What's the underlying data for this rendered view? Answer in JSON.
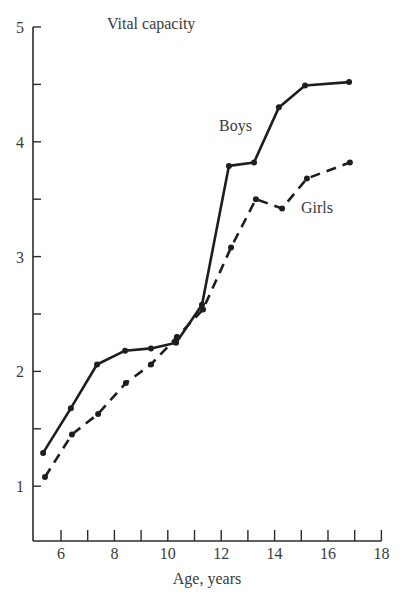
{
  "chart_data": {
    "type": "line",
    "title": "Vital capacity",
    "xlabel": "Age, years",
    "ylabel": "",
    "xlim": [
      5,
      18
    ],
    "ylim": [
      0.52,
      5
    ],
    "x_ticks": [
      6,
      8,
      10,
      12,
      14,
      16,
      18
    ],
    "x_minor_ticks": [
      6,
      7,
      8,
      9,
      10,
      11,
      12,
      13,
      14,
      15,
      16,
      17,
      18
    ],
    "y_ticks": [
      1,
      2,
      3,
      4,
      5
    ],
    "y_minor_ticks": [
      1,
      1.5,
      2,
      2.5,
      3,
      3.5,
      4,
      4.5,
      5
    ],
    "grid": false,
    "legend": "inline labels",
    "series": [
      {
        "name": "Boys",
        "style": "solid",
        "label_pos": [
          13.0,
          4.1
        ],
        "x": [
          5.33,
          6.37,
          7.35,
          8.4,
          9.37,
          10.31,
          11.28,
          12.29,
          13.23,
          14.16,
          15.14,
          16.79
        ],
        "values": [
          1.29,
          1.68,
          2.06,
          2.18,
          2.2,
          2.25,
          2.58,
          3.79,
          3.82,
          4.3,
          4.49,
          4.52
        ]
      },
      {
        "name": "Girls",
        "style": "dashed",
        "label_pos": [
          14.9,
          3.4
        ],
        "x": [
          5.4,
          6.41,
          7.39,
          8.43,
          9.37,
          10.34,
          11.32,
          12.37,
          13.3,
          14.28,
          15.21,
          16.82
        ],
        "values": [
          1.08,
          1.45,
          1.63,
          1.9,
          2.06,
          2.3,
          2.54,
          3.08,
          3.5,
          3.42,
          3.68,
          3.82
        ]
      }
    ]
  },
  "labels": {
    "title": "Vital capacity",
    "xlabel": "Age, years",
    "boys": "Boys",
    "girls": "Girls"
  }
}
